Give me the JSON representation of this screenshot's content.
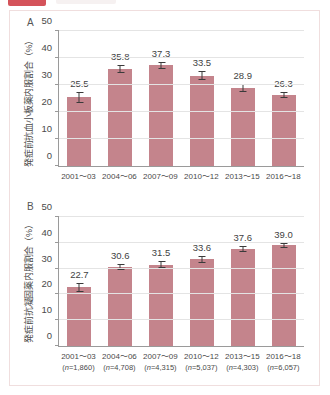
{
  "badge": {
    "label": "",
    "icon": "red-tag-badge"
  },
  "figure": {
    "panels": [
      {
        "letter": "A",
        "ylabel": "発症前抗血小板薬内服割合（%）",
        "yticks": [
          "0",
          "10",
          "20",
          "30",
          "40",
          "50"
        ]
      },
      {
        "letter": "B",
        "ylabel": "発症前抗凝固薬内服割合（%）",
        "yticks": [
          "0",
          "10",
          "20",
          "30",
          "40",
          "50"
        ]
      }
    ]
  },
  "chart_data": [
    {
      "type": "bar",
      "panel": "A",
      "title": "",
      "xlabel": "",
      "ylabel": "発症前抗血小板薬内服割合（%）",
      "ylim": [
        0,
        50
      ],
      "yticks": [
        0,
        10,
        20,
        30,
        40,
        50
      ],
      "grid": true,
      "legend": "none",
      "categories": [
        "2001～03",
        "2004～06",
        "2007～09",
        "2010～12",
        "2013～15",
        "2016～18"
      ],
      "values": [
        25.5,
        35.8,
        37.3,
        33.5,
        28.9,
        26.3
      ],
      "value_labels": [
        "25.5",
        "35.8",
        "37.3",
        "33.5",
        "28.9",
        "26.3"
      ],
      "errors_upper": [
        2.0,
        1.5,
        1.4,
        1.6,
        1.6,
        1.2
      ],
      "errors_lower": [
        2.0,
        1.5,
        1.4,
        1.6,
        1.6,
        1.2
      ],
      "bar_color": "#c4848c"
    },
    {
      "type": "bar",
      "panel": "B",
      "title": "",
      "xlabel": "",
      "ylabel": "発症前抗凝固薬内服割合（%）",
      "ylim": [
        0,
        50
      ],
      "yticks": [
        0,
        10,
        20,
        30,
        40,
        50
      ],
      "grid": true,
      "legend": "none",
      "categories": [
        "2001～03",
        "2004～06",
        "2007～09",
        "2010～12",
        "2013～15",
        "2016～18"
      ],
      "group_sizes": [
        "(n=1,860)",
        "(n=4,708)",
        "(n=4,315)",
        "(n=5,037)",
        "(n=4,303)",
        "(n=6,057)"
      ],
      "values": [
        22.7,
        30.6,
        31.5,
        33.6,
        37.6,
        39.0
      ],
      "value_labels": [
        "22.7",
        "30.6",
        "31.5",
        "33.6",
        "37.6",
        "39.0"
      ],
      "errors_upper": [
        1.8,
        1.3,
        1.4,
        1.3,
        1.3,
        1.1
      ],
      "errors_lower": [
        1.8,
        1.3,
        1.4,
        1.3,
        1.3,
        1.1
      ],
      "bar_color": "#c4848c"
    }
  ]
}
